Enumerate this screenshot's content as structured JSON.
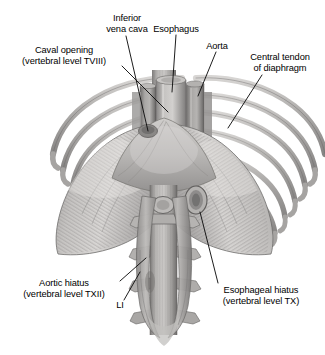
{
  "figure": {
    "background_color": "#ffffff",
    "label_color": "#000000",
    "leader_line_color": "#1a1a1a"
  },
  "labels": [
    {
      "id": "inferior-vena-cava",
      "text": "Inferior\nvena cava",
      "align": "center",
      "x": 96,
      "y": 13,
      "width": 62
    },
    {
      "id": "esophagus",
      "text": "Esophagus",
      "align": "center",
      "x": 147,
      "y": 24,
      "width": 58
    },
    {
      "id": "aorta",
      "text": "Aorta",
      "align": "center",
      "x": 200,
      "y": 41,
      "width": 34
    },
    {
      "id": "caval-opening",
      "text": "Caval opening\n(vertebral level TVIII)",
      "align": "center",
      "x": 8,
      "y": 45,
      "width": 112
    },
    {
      "id": "central-tendon-of-diaphragm",
      "text": "Central tendon\nof diaphragm",
      "align": "center",
      "x": 240,
      "y": 52,
      "width": 80
    },
    {
      "id": "aortic-hiatus",
      "text": "Aortic hiatus\n(vertebral level TXII)",
      "align": "center",
      "x": 8,
      "y": 278,
      "width": 112
    },
    {
      "id": "vertebra-li",
      "text": "LI",
      "align": "center",
      "x": 112,
      "y": 300,
      "width": 16
    },
    {
      "id": "esophageal-hiatus",
      "text": "Esophageal hiatus\n(vertebral level TX)",
      "align": "center",
      "x": 205,
      "y": 285,
      "width": 112
    }
  ],
  "anatomy": {
    "structures": [
      "diaphragm-dome-left",
      "diaphragm-dome-right",
      "central-tendon",
      "esophagus",
      "aorta",
      "inferior-vena-cava",
      "vertebral-column",
      "ribs-left",
      "ribs-right",
      "diaphragmatic-crura"
    ],
    "palette": {
      "tissue_light": "#d6d4d2",
      "tissue_mid": "#b3b1b0",
      "tissue_dark": "#8e8c8b",
      "tissue_deep": "#6e6c6c",
      "bone_light": "#cfcdcb",
      "bone_mid": "#a9a7a6",
      "outline": "#5c5a5a"
    }
  }
}
